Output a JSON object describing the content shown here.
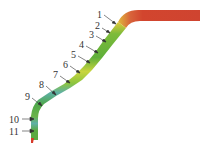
{
  "diagram": {
    "type": "contour-plot-strip",
    "colors": {
      "flange": "#d2452e",
      "flange_edge": "#c93a2a",
      "yellow": "#d8d43a",
      "green": "#6cb23c",
      "light_green": "#9cc943",
      "cyan": "#5fb0a6",
      "tip": "#d83a2a",
      "arrow": "#333333"
    },
    "points": [
      {
        "id": "1",
        "label": "1"
      },
      {
        "id": "2",
        "label": "2"
      },
      {
        "id": "3",
        "label": "3"
      },
      {
        "id": "4",
        "label": "4"
      },
      {
        "id": "5",
        "label": "5"
      },
      {
        "id": "6",
        "label": "6"
      },
      {
        "id": "7",
        "label": "7"
      },
      {
        "id": "8",
        "label": "8"
      },
      {
        "id": "9",
        "label": "9"
      },
      {
        "id": "10",
        "label": "10"
      },
      {
        "id": "11",
        "label": "11"
      }
    ]
  }
}
